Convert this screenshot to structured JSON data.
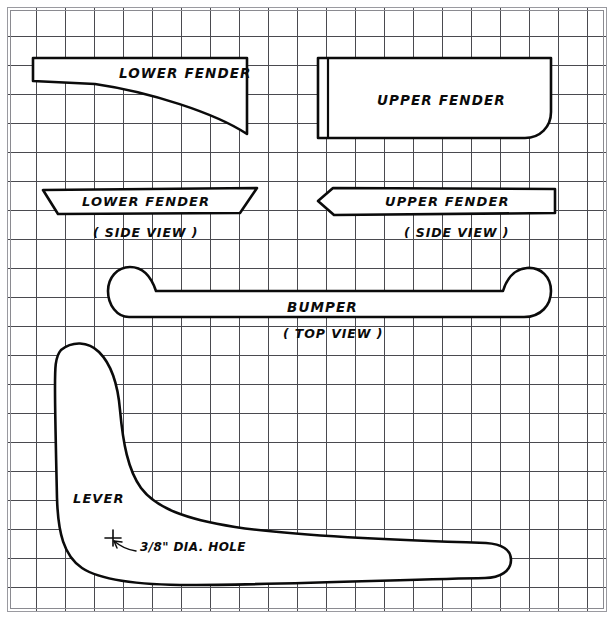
{
  "sheet": {
    "title": "Sheet Metal Parts Pattern Drawing",
    "background_color": "#ffffff",
    "grid_color": "#4a4a4f",
    "ink_color": "#0b0b0b",
    "frame_color": "#9a9aa0",
    "grid_spacing_px": 29,
    "width_px": 614,
    "height_px": 619
  },
  "parts": {
    "lower_fender": {
      "label": "LOWER FENDER",
      "view": "flat pattern",
      "note": ""
    },
    "upper_fender": {
      "label": "UPPER FENDER",
      "view": "flat pattern",
      "note": ""
    },
    "lower_fender_side": {
      "label": "LOWER FENDER",
      "view_label": "( SIDE VIEW )"
    },
    "upper_fender_side": {
      "label": "UPPER FENDER",
      "view_label": "( SIDE VIEW )"
    },
    "bumper": {
      "label": "BUMPER",
      "view_label": "( TOP VIEW )"
    },
    "lever": {
      "label": "LEVER",
      "hole_note": "3/8\" DIA. HOLE"
    }
  },
  "annotations": [
    {
      "name": "hole-callout",
      "text": "3/8\" DIA. HOLE"
    }
  ]
}
